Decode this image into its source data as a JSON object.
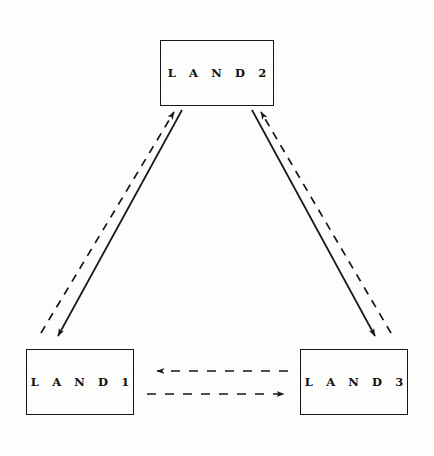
{
  "diagram": {
    "background_color": "#fdfdfc",
    "line_color": "#16161a",
    "nodes": [
      {
        "id": "land2",
        "label": "L A N D   2",
        "x": 160,
        "y": 40,
        "width": 114,
        "height": 66
      },
      {
        "id": "land1",
        "label": "L A N D   1",
        "x": 26,
        "y": 349,
        "width": 108,
        "height": 66
      },
      {
        "id": "land3",
        "label": "L A N D   3",
        "x": 300,
        "y": 349,
        "width": 108,
        "height": 66
      }
    ],
    "edges": [
      {
        "id": "land2-to-land1",
        "from": "land2",
        "to": "land1",
        "style": "solid",
        "direction": "down-left",
        "arrowhead": "at-land1"
      },
      {
        "id": "land1-to-land2",
        "from": "land1",
        "to": "land2",
        "style": "dashed",
        "direction": "up-right",
        "arrowhead": "at-land2"
      },
      {
        "id": "land2-to-land3",
        "from": "land2",
        "to": "land3",
        "style": "solid",
        "direction": "down-right",
        "arrowhead": "at-land3"
      },
      {
        "id": "land3-to-land2",
        "from": "land3",
        "to": "land2",
        "style": "dashed",
        "direction": "up-left",
        "arrowhead": "at-land2"
      },
      {
        "id": "land3-to-land1",
        "from": "land3",
        "to": "land1",
        "style": "dashed",
        "direction": "left",
        "arrowhead": "at-land1"
      },
      {
        "id": "land1-to-land3",
        "from": "land1",
        "to": "land3",
        "style": "dashed",
        "direction": "right",
        "arrowhead": "at-land3"
      }
    ]
  }
}
